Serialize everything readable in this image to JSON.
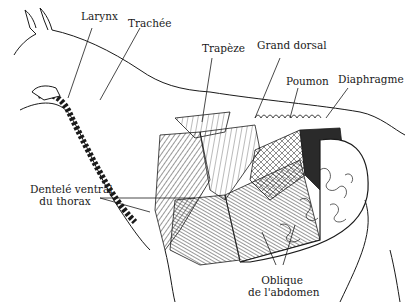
{
  "figure": {
    "labels": [
      {
        "id": "larynx",
        "text": "Larynx"
      },
      {
        "id": "trachee",
        "text": "Trachée"
      },
      {
        "id": "trapeze",
        "text": "Trapèze"
      },
      {
        "id": "grand-dorsal",
        "text": "Grand dorsal"
      },
      {
        "id": "poumon",
        "text": "Poumon"
      },
      {
        "id": "diaphragme",
        "text": "Diaphragme"
      },
      {
        "id": "dentele-ventral",
        "lines": [
          "Dentelé ventral",
          "du thorax"
        ]
      },
      {
        "id": "oblique-abdomen",
        "lines": [
          "Oblique",
          "de l'abdomen"
        ]
      }
    ]
  }
}
